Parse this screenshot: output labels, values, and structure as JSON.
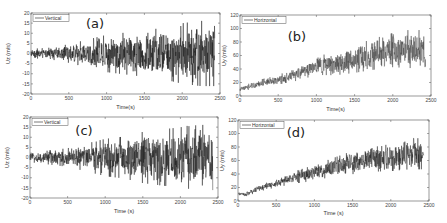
{
  "chart_data": [
    {
      "id": "a",
      "type": "line",
      "panel_label": "(a)",
      "legend": "Vertical",
      "xlabel": "Time(s)",
      "ylabel": "Uz (m/s)",
      "xlim": [
        0,
        2500
      ],
      "ylim": [
        -20,
        20
      ],
      "xticks": [
        0,
        500,
        1000,
        1500,
        2000,
        2500
      ],
      "yticks": [
        -20,
        -15,
        -10,
        -5,
        0,
        5,
        10,
        15,
        20
      ],
      "grid": false,
      "legend_position": "upper left",
      "series": [
        {
          "name": "Vertical",
          "color": "#111111",
          "envelope": {
            "x": [
              0,
              250,
              500,
              750,
              1000,
              1250,
              1500,
              1750,
              2000,
              2250,
              2430
            ],
            "mean": [
              0,
              0,
              0,
              0,
              0,
              0,
              0,
              0,
              0,
              0,
              0
            ],
            "amplitude": [
              2,
              2.5,
              4,
              6,
              8,
              9,
              10,
              11,
              13,
              14,
              14
            ]
          }
        }
      ]
    },
    {
      "id": "b",
      "type": "line",
      "panel_label": "(b)",
      "legend": "Horizontal",
      "xlabel": "Time(s)",
      "ylabel": "Uy (m/s)",
      "xlim": [
        0,
        2500
      ],
      "ylim": [
        0,
        120
      ],
      "xticks": [
        0,
        500,
        1000,
        1500,
        2000,
        2500
      ],
      "yticks": [
        0,
        20,
        40,
        60,
        80,
        100,
        120
      ],
      "grid": false,
      "legend_position": "upper left",
      "series": [
        {
          "name": "Horizontal",
          "color": "#444444",
          "envelope": {
            "x": [
              0,
              250,
              500,
              750,
              1000,
              1250,
              1500,
              1750,
              2000,
              2250,
              2430
            ],
            "mean": [
              10,
              18,
              24,
              33,
              45,
              48,
              55,
              62,
              68,
              70,
              68
            ],
            "amplitude": [
              3,
              5,
              6,
              9,
              12,
              15,
              18,
              20,
              22,
              25,
              25
            ]
          }
        }
      ]
    },
    {
      "id": "c",
      "type": "line",
      "panel_label": "(c)",
      "legend": "Vertical",
      "xlabel": "Time (s)",
      "ylabel": "Uz (m/s)",
      "xlim": [
        0,
        2500
      ],
      "ylim": [
        -20,
        20
      ],
      "xticks": [
        0,
        500,
        1000,
        1500,
        2000,
        2500
      ],
      "yticks": [
        -20,
        -15,
        -10,
        -5,
        0,
        5,
        10,
        15,
        20
      ],
      "grid": false,
      "legend_position": "upper left",
      "series": [
        {
          "name": "Vertical",
          "color": "#1a1a1a",
          "envelope": {
            "x": [
              0,
              250,
              500,
              750,
              1000,
              1250,
              1500,
              1750,
              2000,
              2250,
              2430
            ],
            "mean": [
              0,
              0,
              0,
              0,
              0,
              0,
              0,
              0,
              0,
              0,
              0
            ],
            "amplitude": [
              2,
              3,
              4,
              6,
              8,
              9,
              11,
              12,
              13,
              14,
              14
            ]
          }
        }
      ]
    },
    {
      "id": "d",
      "type": "line",
      "panel_label": "(d)",
      "legend": "Horizontal",
      "xlabel": "Time (s)",
      "ylabel": "Uy (m/s)",
      "xlim": [
        0,
        2500
      ],
      "ylim": [
        0,
        120
      ],
      "xticks": [
        0,
        500,
        1000,
        1500,
        2000,
        2500
      ],
      "yticks": [
        0,
        20,
        40,
        60,
        80,
        100,
        120
      ],
      "grid": false,
      "legend_position": "upper left",
      "series": [
        {
          "name": "Horizontal",
          "color": "#222222",
          "envelope": {
            "x": [
              0,
              100,
              250,
              500,
              750,
              1000,
              1250,
              1500,
              1750,
              2000,
              2250,
              2430
            ],
            "mean": [
              11,
              9,
              18,
              26,
              35,
              42,
              50,
              57,
              63,
              65,
              70,
              70
            ],
            "amplitude": [
              2,
              3,
              4,
              5,
              8,
              10,
              12,
              15,
              17,
              18,
              20,
              20
            ]
          }
        }
      ]
    }
  ],
  "layout": {
    "panels": {
      "a": {
        "left": 31,
        "top": 13,
        "right": 220,
        "bottom": 94,
        "label_x": 95,
        "label_y": 28,
        "ylabel_x": 10,
        "xlabel_y": 109
      },
      "b": {
        "left": 240,
        "top": 15,
        "right": 431,
        "bottom": 96,
        "label_x": 297,
        "label_y": 41,
        "ylabel_x": 226,
        "xlabel_y": 111
      },
      "c": {
        "left": 30,
        "top": 117,
        "right": 218,
        "bottom": 198,
        "label_x": 84,
        "label_y": 135,
        "ylabel_x": 9,
        "xlabel_y": 213
      },
      "d": {
        "left": 238,
        "top": 120,
        "right": 429,
        "bottom": 201,
        "label_x": 296,
        "label_y": 137,
        "ylabel_x": 224,
        "xlabel_y": 215
      }
    }
  }
}
